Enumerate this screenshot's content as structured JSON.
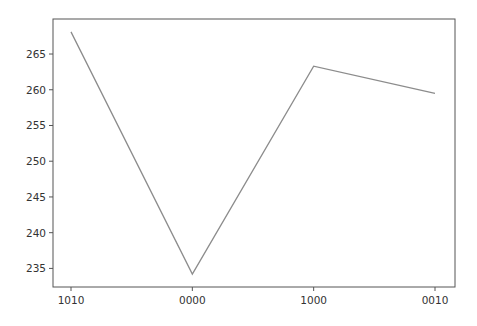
{
  "chart_data": {
    "type": "line",
    "title": "",
    "xlabel": "",
    "ylabel": "",
    "categories": [
      "1010",
      "0000",
      "1000",
      "0010"
    ],
    "series": [
      {
        "name": "series-1",
        "values": [
          268.1,
          234.2,
          263.3,
          259.5
        ],
        "color": "#8c8c8c"
      }
    ],
    "yticks": [
      235,
      240,
      245,
      250,
      255,
      260,
      265
    ],
    "ylim": [
      232.4,
      269.9
    ],
    "grid": false,
    "legend": null
  }
}
